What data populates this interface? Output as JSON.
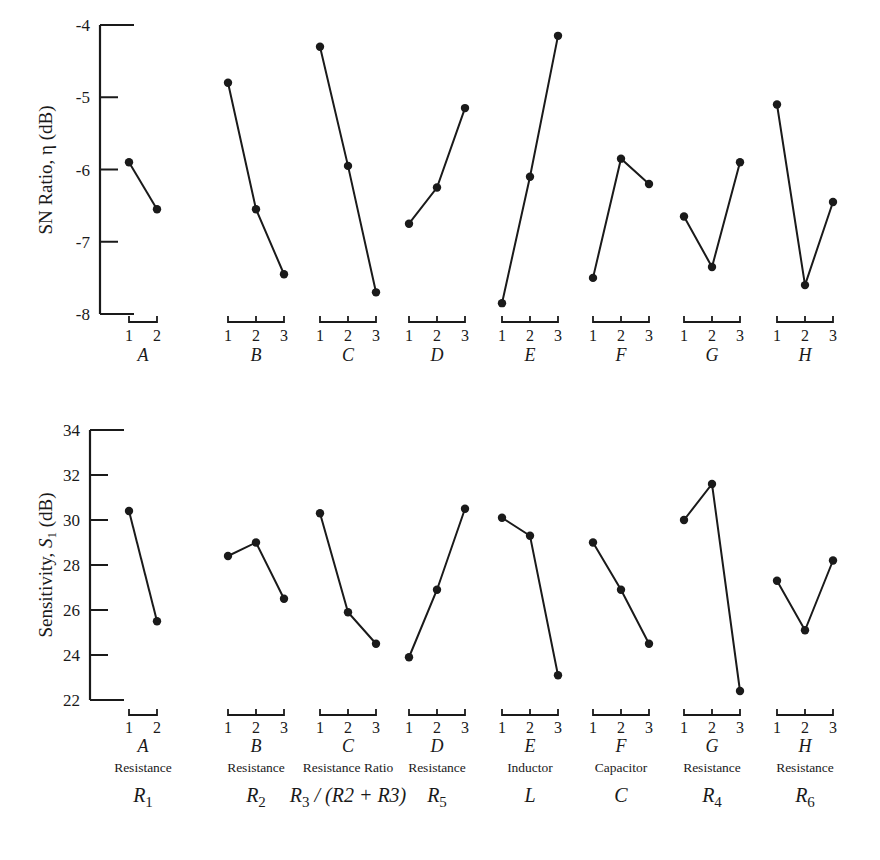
{
  "chart_data": [
    {
      "type": "line",
      "title": "",
      "ylabel": "SN Ratio, η (dB)",
      "xlabel": "",
      "ylim": [
        -8,
        -4
      ],
      "yticks": [
        "-4",
        "-5",
        "-6",
        "-7",
        "-8"
      ],
      "ytick_values": [
        -4,
        -5,
        -6,
        -7,
        -8
      ],
      "grid": false,
      "factors": [
        {
          "name": "A",
          "levels": [
            "1",
            "2"
          ],
          "values": [
            -5.9,
            -6.55
          ]
        },
        {
          "name": "B",
          "levels": [
            "1",
            "2",
            "3"
          ],
          "values": [
            -4.8,
            -6.55,
            -7.45
          ]
        },
        {
          "name": "C",
          "levels": [
            "1",
            "2",
            "3"
          ],
          "values": [
            -4.3,
            -5.95,
            -7.7
          ]
        },
        {
          "name": "D",
          "levels": [
            "1",
            "2",
            "3"
          ],
          "values": [
            -6.75,
            -6.25,
            -5.15
          ]
        },
        {
          "name": "E",
          "levels": [
            "1",
            "2",
            "3"
          ],
          "values": [
            -7.85,
            -6.1,
            -4.15
          ]
        },
        {
          "name": "F",
          "levels": [
            "1",
            "2",
            "3"
          ],
          "values": [
            -7.5,
            -5.85,
            -6.2
          ]
        },
        {
          "name": "G",
          "levels": [
            "1",
            "2",
            "3"
          ],
          "values": [
            -6.65,
            -7.35,
            -5.9
          ]
        },
        {
          "name": "H",
          "levels": [
            "1",
            "2",
            "3"
          ],
          "values": [
            -5.1,
            -7.6,
            -6.45
          ]
        }
      ]
    },
    {
      "type": "line",
      "title": "",
      "ylabel_prefix": "Sensitivity, ",
      "ylabel_symbol": "S",
      "ylabel_sub": "1",
      "ylabel_suffix": " (dB)",
      "xlabel": "",
      "ylim": [
        22,
        34
      ],
      "yticks": [
        "34",
        "32",
        "30",
        "28",
        "26",
        "24",
        "22"
      ],
      "ytick_values": [
        34,
        32,
        30,
        28,
        26,
        24,
        22
      ],
      "grid": false,
      "factors": [
        {
          "name": "A",
          "levels": [
            "1",
            "2"
          ],
          "values": [
            30.4,
            25.5
          ],
          "description": "Resistance",
          "symbol": "R",
          "sub": "1",
          "symbol_tail": ""
        },
        {
          "name": "B",
          "levels": [
            "1",
            "2",
            "3"
          ],
          "values": [
            28.4,
            29.0,
            26.5
          ],
          "description": "Resistance",
          "symbol": "R",
          "sub": "2",
          "symbol_tail": ""
        },
        {
          "name": "C",
          "levels": [
            "1",
            "2",
            "3"
          ],
          "values": [
            30.3,
            25.9,
            24.5
          ],
          "description": "Resistance Ratio",
          "symbol": "R",
          "sub": "3",
          "symbol_tail": " / (R2 + R3)"
        },
        {
          "name": "D",
          "levels": [
            "1",
            "2",
            "3"
          ],
          "values": [
            23.9,
            26.9,
            30.5
          ],
          "description": "Resistance",
          "symbol": "R",
          "sub": "5",
          "symbol_tail": ""
        },
        {
          "name": "E",
          "levels": [
            "1",
            "2",
            "3"
          ],
          "values": [
            30.1,
            29.3,
            23.1
          ],
          "description": "Inductor",
          "symbol": "L",
          "sub": "",
          "symbol_tail": ""
        },
        {
          "name": "F",
          "levels": [
            "1",
            "2",
            "3"
          ],
          "values": [
            29.0,
            26.9,
            24.5
          ],
          "description": "Capacitor",
          "symbol": "C",
          "sub": "",
          "symbol_tail": ""
        },
        {
          "name": "G",
          "levels": [
            "1",
            "2",
            "3"
          ],
          "values": [
            30.0,
            31.6,
            22.4
          ],
          "description": "Resistance",
          "symbol": "R",
          "sub": "4",
          "symbol_tail": ""
        },
        {
          "name": "H",
          "levels": [
            "1",
            "2",
            "3"
          ],
          "values": [
            27.3,
            25.1,
            28.2
          ],
          "description": "Resistance",
          "symbol": "R",
          "sub": "6",
          "symbol_tail": ""
        }
      ]
    }
  ]
}
